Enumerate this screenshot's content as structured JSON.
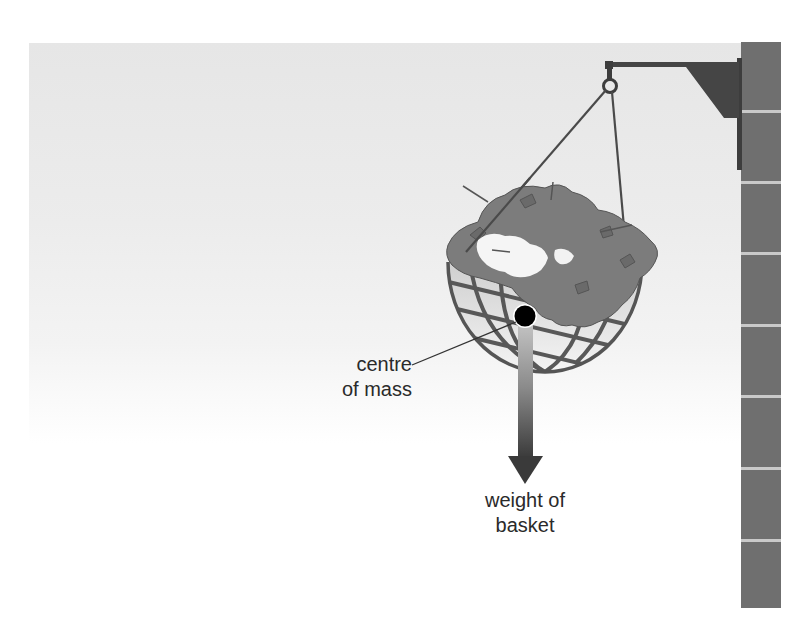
{
  "diagram": {
    "labels": {
      "centre_of_mass_line1": "centre",
      "centre_of_mass_line2": "of mass",
      "weight_line1": "weight of",
      "weight_line2": "basket"
    },
    "elements": {
      "wall": "brick wall column",
      "bracket": "wall bracket",
      "hook": "hook ring",
      "chains": 2,
      "basket": "wire hemisphere basket with plants",
      "centre_of_mass_marker": "black dot",
      "weight_arrow": "downward arrow"
    },
    "colors": {
      "wall_brick": "#6f6f6f",
      "mortar": "#c9c9c9",
      "bracket": "#4a4a4a",
      "foliage": "#7a7a7a",
      "basket_wire": "#5a5a5a",
      "arrow_dark": "#3a3a3a",
      "dot": "#000000",
      "text": "#2a2a2a"
    }
  }
}
